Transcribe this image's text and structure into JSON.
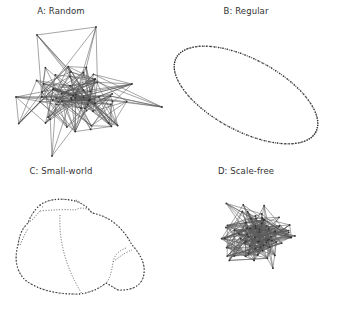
{
  "figure": {
    "panels": [
      {
        "id": "A",
        "title": "A: Random",
        "title_x": 61,
        "title_y": 12,
        "type": "random"
      },
      {
        "id": "B",
        "title": "B: Regular",
        "title_x": 246,
        "title_y": 12,
        "type": "regular"
      },
      {
        "id": "C",
        "title": "C: Small-world",
        "title_x": 61,
        "title_y": 172,
        "type": "small-world"
      },
      {
        "id": "D",
        "title": "D: Scale-free",
        "title_x": 246,
        "title_y": 172,
        "type": "scale-free"
      }
    ]
  },
  "networks": {
    "random": {
      "seed": 17,
      "node_count": 60,
      "bbox": [
        16,
        32,
        163,
        157
      ],
      "center": [
        75,
        100
      ],
      "extra_nodes": [
        [
          37,
          35
        ],
        [
          96,
          27
        ],
        [
          162,
          107
        ],
        [
          132,
          84
        ],
        [
          16,
          97
        ],
        [
          52,
          156
        ]
      ],
      "edges_per_node": 3.2
    },
    "regular": {
      "center": [
        246,
        95
      ],
      "rx": 79,
      "ry": 36,
      "rotation_deg": 28,
      "node_count": 100
    },
    "small_world": {
      "outer": "M 40 205 Q 52 197 70 200 Q 84 202 92 213 Q 118 218 132 245 Q 148 262 143 278 Q 138 291 118 290 L 106 283 Q 95 292 80 294 Q 45 295 25 280 Q 12 266 18 245 Q 20 230 28 223 Q 32 212 40 205 Z",
      "chords": [
        "M 60 215 Q 58 255 82 294",
        "M 40 211 Q 60 209 75 210 Q 85 205 92 213",
        "M 126 248 Q 115 252 113 262 Q 111 278 106 283",
        "M 113 262 Q 125 252 132 250",
        "M 28 223 L 33 219 L 40 211",
        "M 20 245 L 24 236 L 28 228",
        "M 40 205 L 44 208",
        "M 76 200 L 80 202"
      ],
      "node_count": 110
    },
    "scale_free": {
      "seed": 41,
      "node_count": 70,
      "bbox": [
        196,
        190,
        316,
        300
      ],
      "center": [
        258,
        236
      ],
      "edges_per_node": 3.6
    }
  },
  "colors": {
    "edge": "#5a5a5a",
    "node": "#333333",
    "title": "#333333",
    "background": "#ffffff"
  }
}
